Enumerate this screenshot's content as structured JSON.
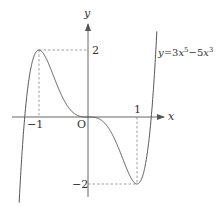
{
  "chart_data": {
    "type": "line",
    "title": "",
    "function": "y=3x^5-5x^3",
    "equation_label": {
      "prefix": "y",
      "eq": "=3",
      "var1": "x",
      "exp1": "5",
      "mid": "−5",
      "var2": "x",
      "exp2": "3"
    },
    "xlabel": "x",
    "ylabel": "y",
    "origin_label": "O",
    "x_tick_labels": [
      "−1",
      "1"
    ],
    "y_tick_labels": [
      "2",
      "−2"
    ],
    "xlim": [
      -1.45,
      1.55
    ],
    "ylim": [
      -2.4,
      3.3
    ],
    "grid": false,
    "key_points": [
      {
        "x": -1,
        "y": 2,
        "type": "local maximum"
      },
      {
        "x": 1,
        "y": -2,
        "type": "local minimum"
      },
      {
        "x": 0,
        "y": 0,
        "type": "inflection point"
      }
    ],
    "roots": [
      -1.291,
      0,
      1.291
    ],
    "samples": {
      "x": [
        -1.4,
        -1.3,
        -1.2,
        -1.1,
        -1.0,
        -0.9,
        -0.8,
        -0.7,
        -0.6,
        -0.5,
        -0.4,
        -0.3,
        -0.2,
        -0.1,
        0.0,
        0.1,
        0.2,
        0.3,
        0.4,
        0.5,
        0.6,
        0.7,
        0.8,
        0.9,
        1.0,
        1.1,
        1.2,
        1.3,
        1.4
      ],
      "y": [
        -2.41,
        -0.25,
        1.18,
        1.83,
        2.0,
        1.87,
        1.58,
        1.21,
        0.85,
        0.53,
        0.29,
        0.13,
        0.04,
        0.005,
        0.0,
        -0.005,
        -0.04,
        -0.13,
        -0.29,
        -0.53,
        -0.85,
        -1.21,
        -1.58,
        -1.87,
        -2.0,
        -1.83,
        -1.18,
        0.25,
        2.41
      ]
    },
    "colors": {
      "curve": "#555555",
      "axis": "#555555",
      "guide": "#888888"
    }
  }
}
